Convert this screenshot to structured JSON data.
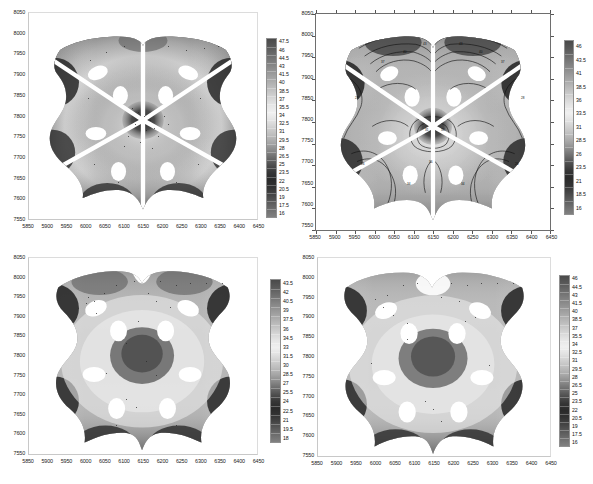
{
  "figure": {
    "kind": "four-panel-contour-figure",
    "background": "#ffffff",
    "colormap": "grayscale-jet",
    "panel_count": 4
  },
  "chart_data": [
    {
      "id": "panel-1",
      "type": "heatmap",
      "title": "",
      "xlabel": "",
      "ylabel": "",
      "grid": false,
      "framed": false,
      "filled_contour": true,
      "line_contours": false,
      "radial_slots": true,
      "xlim": [
        5850,
        6450
      ],
      "ylim": [
        7550,
        8050
      ],
      "xticks": [
        5850,
        5900,
        5950,
        6000,
        6050,
        6100,
        6150,
        6200,
        6250,
        6300,
        6350,
        6400,
        6450
      ],
      "yticks": [
        8050,
        8000,
        7950,
        7900,
        7850,
        7800,
        7750,
        7700,
        7650,
        7600,
        7550
      ],
      "colorbar": {
        "position": "right",
        "orientation": "vertical",
        "vmin": 16,
        "vmax": 47.5,
        "step": 1.5,
        "ticks": [
          47.5,
          46,
          44.5,
          43,
          41.5,
          40,
          38.5,
          37,
          35.5,
          34,
          32.5,
          31,
          29.5,
          28,
          26.5,
          25,
          23.5,
          22,
          20.5,
          19,
          17.5,
          16
        ]
      }
    },
    {
      "id": "panel-2",
      "type": "heatmap",
      "title": "",
      "xlabel": "",
      "ylabel": "",
      "grid": false,
      "framed": true,
      "filled_contour": true,
      "line_contours": true,
      "radial_slots": true,
      "xlim": [
        5850,
        6450
      ],
      "ylim": [
        7550,
        8050
      ],
      "xticks": [
        5850,
        5900,
        5950,
        6000,
        6050,
        6100,
        6150,
        6200,
        6250,
        6300,
        6350,
        6400,
        6450
      ],
      "yticks": [
        8050,
        8000,
        7950,
        7900,
        7850,
        7800,
        7750,
        7700,
        7650,
        7600,
        7550
      ],
      "colorbar": {
        "position": "right",
        "orientation": "vertical",
        "vmin": 16,
        "vmax": 46,
        "step": 2.5,
        "ticks": [
          46,
          43.5,
          41,
          38.5,
          36,
          33.5,
          31,
          28.5,
          26,
          23.5,
          21,
          18.5,
          16
        ]
      }
    },
    {
      "id": "panel-3",
      "type": "heatmap",
      "title": "",
      "xlabel": "",
      "ylabel": "",
      "grid": false,
      "framed": false,
      "filled_contour": true,
      "line_contours": false,
      "radial_slots": false,
      "xlim": [
        5850,
        6450
      ],
      "ylim": [
        7550,
        8050
      ],
      "xticks": [
        5850,
        5900,
        5950,
        6000,
        6050,
        6100,
        6150,
        6200,
        6250,
        6300,
        6350,
        6400,
        6450
      ],
      "yticks": [
        8050,
        8000,
        7950,
        7900,
        7850,
        7800,
        7750,
        7700,
        7650,
        7600,
        7550
      ],
      "colorbar": {
        "position": "right",
        "orientation": "vertical",
        "vmin": 18,
        "vmax": 43.5,
        "step": 1.5,
        "ticks": [
          43.5,
          42,
          40.5,
          39,
          37.5,
          36,
          34.5,
          33,
          31.5,
          30,
          28.5,
          27,
          25.5,
          24,
          22.5,
          21,
          19.5,
          18
        ]
      }
    },
    {
      "id": "panel-4",
      "type": "heatmap",
      "title": "",
      "xlabel": "",
      "ylabel": "",
      "grid": false,
      "framed": false,
      "filled_contour": true,
      "line_contours": false,
      "radial_slots": false,
      "xlim": [
        5850,
        6450
      ],
      "ylim": [
        7550,
        8050
      ],
      "xticks": [
        5850,
        5900,
        5950,
        6000,
        6050,
        6100,
        6150,
        6200,
        6250,
        6300,
        6350,
        6400,
        6450
      ],
      "yticks": [
        8050,
        8000,
        7950,
        7900,
        7850,
        7800,
        7750,
        7700,
        7650,
        7600,
        7550
      ],
      "colorbar": {
        "position": "right",
        "orientation": "vertical",
        "vmin": 16,
        "vmax": 46,
        "step": 1.5,
        "ticks": [
          46,
          44.5,
          43,
          41.5,
          40,
          38.5,
          37,
          35.5,
          34,
          32.5,
          31,
          29.5,
          28,
          26.5,
          25,
          23.5,
          22,
          20.5,
          19,
          17.5,
          16
        ]
      }
    }
  ],
  "colorscale": {
    "stops": [
      "#4a4a4a",
      "#585858",
      "#6a6a6a",
      "#7c7c7c",
      "#8e8e8e",
      "#a0a0a0",
      "#b2b2b2",
      "#c4c4c4",
      "#d6d6d6",
      "#e6e6e6",
      "#f0f0f0",
      "#e2e2e2",
      "#cfcfcf",
      "#bcbcbc",
      "#a6a6a6",
      "#8a8a8a",
      "#6c6c6c",
      "#4e4e4e",
      "#363636",
      "#2a2a2a",
      "#333333",
      "#454545",
      "#5a5a5a",
      "#6e6e6e",
      "#808080"
    ]
  }
}
